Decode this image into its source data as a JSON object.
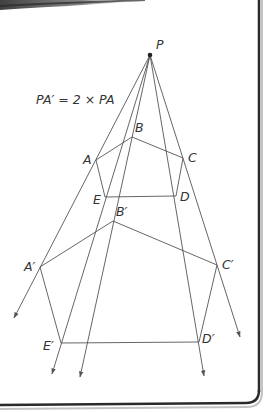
{
  "diagram": {
    "equation": "PA′ = 2 × PA",
    "centre": {
      "label": "P",
      "x": 150,
      "y": 55
    },
    "original": [
      {
        "label": "A",
        "x": 96,
        "y": 160
      },
      {
        "label": "B",
        "x": 132,
        "y": 137
      },
      {
        "label": "C",
        "x": 183,
        "y": 158
      },
      {
        "label": "D",
        "x": 176,
        "y": 196
      },
      {
        "label": "E",
        "x": 105,
        "y": 197
      }
    ],
    "image": [
      {
        "label": "A′",
        "x": 40,
        "y": 267
      },
      {
        "label": "B′",
        "x": 113,
        "y": 221
      },
      {
        "label": "C′",
        "x": 217,
        "y": 265
      },
      {
        "label": "D′",
        "x": 199,
        "y": 342
      },
      {
        "label": "E′",
        "x": 61,
        "y": 343
      }
    ],
    "rays": [
      {
        "through": "A",
        "end_x": 14,
        "end_y": 318
      },
      {
        "through": "E",
        "end_x": 52,
        "end_y": 374
      },
      {
        "through": "B",
        "end_x": 80,
        "end_y": 377
      },
      {
        "through": "D",
        "end_x": 204,
        "end_y": 376
      },
      {
        "through": "C",
        "end_x": 240,
        "end_y": 337
      }
    ],
    "colors": {
      "line": "#555555",
      "text": "#333333",
      "frame": "#2a2a2a",
      "background": "#ffffff"
    }
  }
}
